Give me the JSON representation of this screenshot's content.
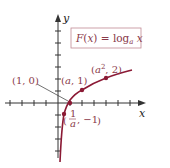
{
  "diagram": {
    "formula_label": "F(x) = log_a x",
    "formula_parts": {
      "lhs": "F(x) = log",
      "sub": "a",
      "rhs": " x"
    },
    "axes": {
      "x_label": "x",
      "y_label": "y"
    },
    "colors": {
      "curve": "#8b1a35",
      "axes": "#333333",
      "labels": "#8a3a4a",
      "box_border": "#c08a95"
    },
    "points": [
      {
        "id": "one-zero",
        "label": "(1, 0)",
        "x": 1,
        "y": 0
      },
      {
        "id": "a-one",
        "label": "(a, 1)",
        "x": "a",
        "y": 1
      },
      {
        "id": "a2-two",
        "label_base": "(a",
        "label_sup": "2",
        "label_tail": ", 2)",
        "x": "a^2",
        "y": 2
      },
      {
        "id": "inv-a-neg1",
        "label_num": "1",
        "label_den": "a",
        "label_tail": ", −1",
        "x": "1/a",
        "y": -1
      }
    ]
  }
}
